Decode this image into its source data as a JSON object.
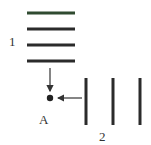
{
  "diagram": {
    "labels": {
      "group1": "1",
      "group2": "2",
      "point": "A"
    },
    "colors": {
      "line": "#2b2b2b",
      "first_line": "#2f4a30",
      "arrow": "#333333",
      "point": "#222222"
    },
    "group1": {
      "orientation": "horizontal",
      "count": 4
    },
    "group2": {
      "orientation": "vertical",
      "count": 3
    }
  }
}
